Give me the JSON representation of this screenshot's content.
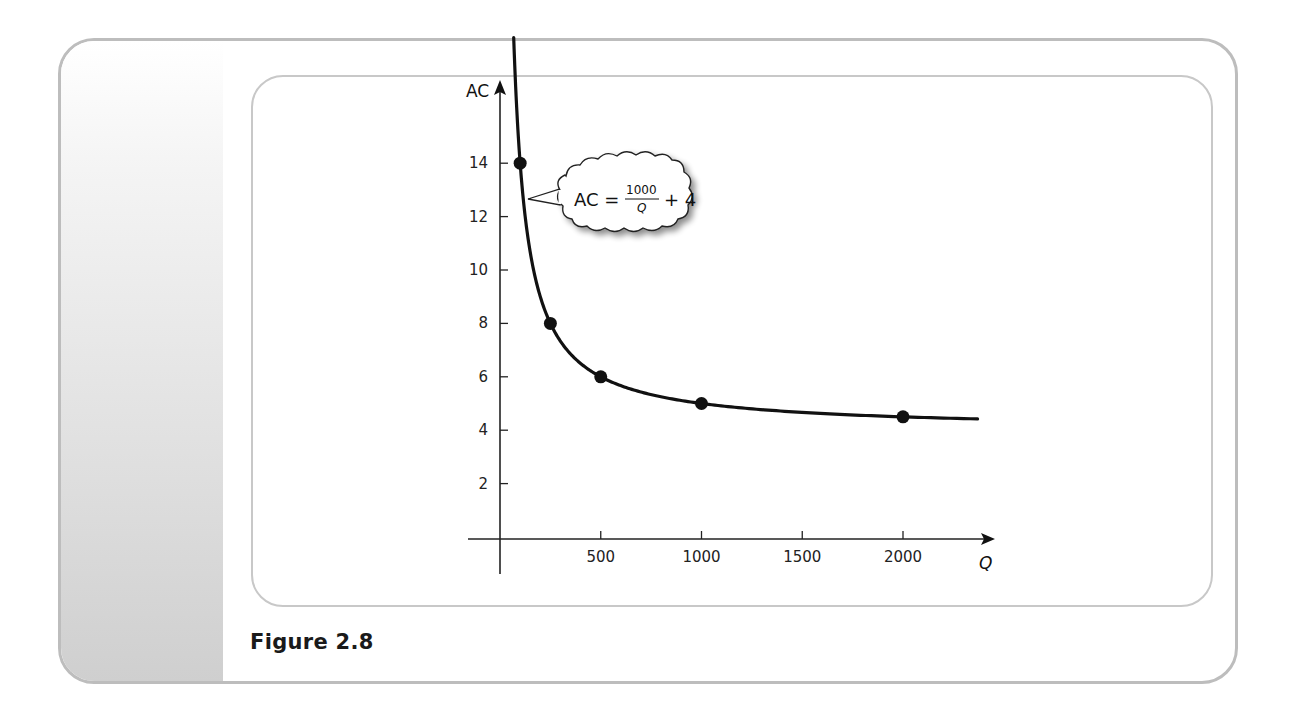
{
  "figure": {
    "caption": "Figure 2.8"
  },
  "colors": {
    "frame": "#bdbdbd",
    "inner_frame": "#c8c8c8",
    "curve": "#111111",
    "axis": "#222222"
  },
  "annotation": {
    "lhs": "AC =",
    "numerator": "1000",
    "denominator": "Q",
    "rhs": "+ 4"
  },
  "chart_data": {
    "type": "line",
    "title": "",
    "xlabel": "Q",
    "ylabel": "AC",
    "xlim": [
      0,
      2200
    ],
    "ylim": [
      0,
      15
    ],
    "x_ticks": [
      500,
      1000,
      1500,
      2000
    ],
    "x_tick_labels": [
      "500",
      "1000",
      "1500",
      "2000"
    ],
    "y_ticks": [
      2,
      4,
      6,
      8,
      10,
      12,
      14
    ],
    "y_tick_labels": [
      "2",
      "4",
      "6",
      "8",
      "10",
      "12",
      "14"
    ],
    "grid": false,
    "legend": null,
    "series": [
      {
        "name": "AC = 1000/Q + 4",
        "formula": "AC = 1000/Q + 4",
        "curve_domain": [
          68,
          2370
        ],
        "marked_points": [
          {
            "x": 100,
            "y": 14
          },
          {
            "x": 250,
            "y": 8
          },
          {
            "x": 500,
            "y": 6
          },
          {
            "x": 1000,
            "y": 5
          },
          {
            "x": 2000,
            "y": 4.5
          }
        ]
      }
    ],
    "annotations": [
      "AC = 1000/Q + 4"
    ]
  }
}
